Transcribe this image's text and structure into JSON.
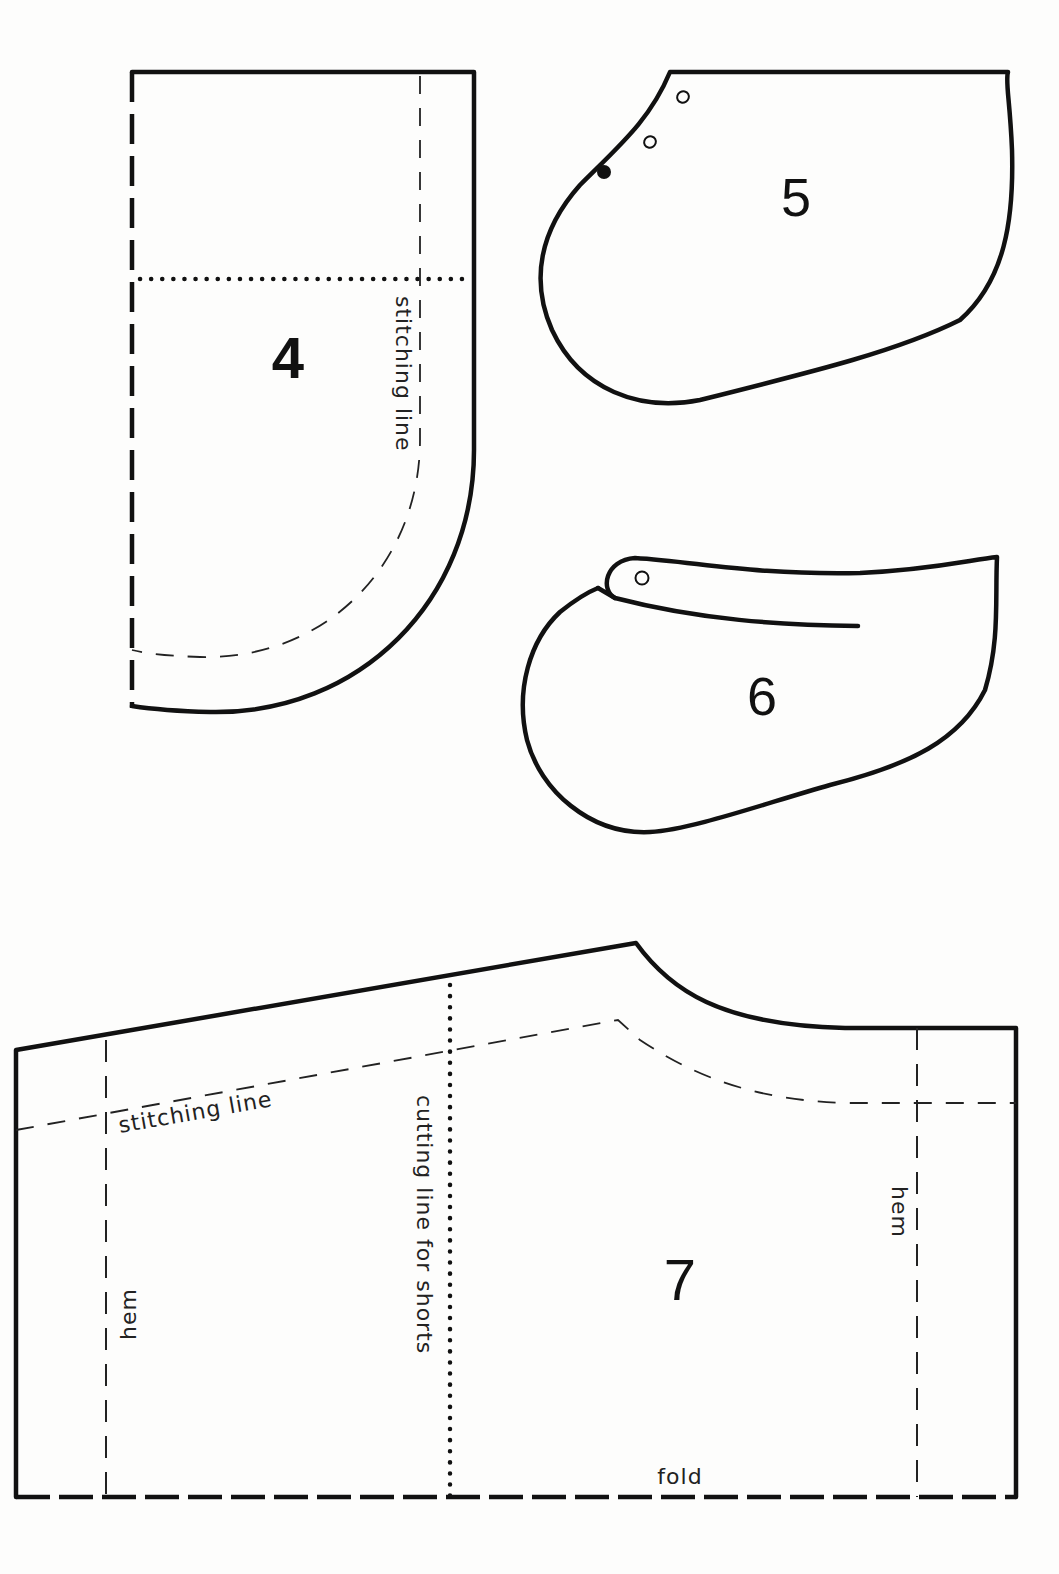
{
  "sheet": {
    "background": "#fdfdfc",
    "ink": "#111111"
  },
  "pieces": {
    "p4": {
      "number": "4",
      "labels": {
        "stitching": "stitching line"
      }
    },
    "p5": {
      "number": "5",
      "markings": [
        "open-circle",
        "open-circle",
        "solid-dot"
      ]
    },
    "p6": {
      "number": "6",
      "markings": [
        "open-circle"
      ]
    },
    "p7": {
      "number": "7",
      "labels": {
        "stitching": "stitching line",
        "cutting": "cutting line for shorts",
        "hem_left": "hem",
        "hem_right": "hem",
        "fold": "fold"
      }
    }
  }
}
